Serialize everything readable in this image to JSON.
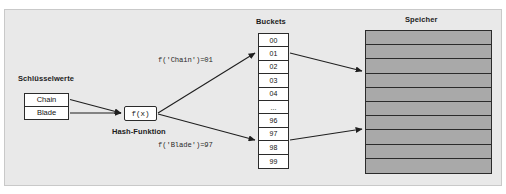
{
  "diagram": {
    "title_keys": "Schlüsselwerte",
    "title_buckets": "Buckets",
    "title_speicher": "Speicher",
    "hash_label": "Hash-Funktion",
    "hash_box_label": "f(x)",
    "keys": [
      {
        "label": "Chain"
      },
      {
        "label": "Blade"
      }
    ],
    "formulas": [
      {
        "text": "f('Chain')=01"
      },
      {
        "text": "f('Blade')=97"
      }
    ],
    "buckets": [
      {
        "label": "00"
      },
      {
        "label": "01"
      },
      {
        "label": "02"
      },
      {
        "label": "03"
      },
      {
        "label": "04"
      },
      {
        "label": "..."
      },
      {
        "label": "96"
      },
      {
        "label": "97"
      },
      {
        "label": "98"
      },
      {
        "label": "99"
      }
    ],
    "memory_rows": 10,
    "colors": {
      "plate_background": "#e9e9e9",
      "memory_fill": "#a9a9a9",
      "stroke": "#2b2b2b",
      "box_fill": "#ffffff",
      "text": "#121212"
    }
  }
}
